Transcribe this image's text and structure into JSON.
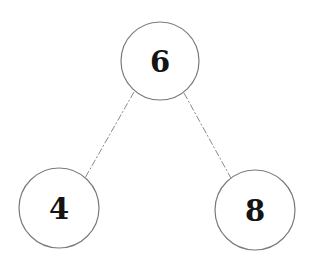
{
  "diagram": {
    "type": "binary-tree",
    "nodes": [
      {
        "id": "root",
        "label": "6",
        "cx": 160,
        "cy": 61,
        "r": 39
      },
      {
        "id": "left",
        "label": "4",
        "cx": 59,
        "cy": 208,
        "r": 40
      },
      {
        "id": "right",
        "label": "8",
        "cx": 255,
        "cy": 210,
        "r": 40
      }
    ],
    "edges": [
      {
        "from": "root",
        "to": "left",
        "x1": 134,
        "y1": 92,
        "x2": 85,
        "y2": 178
      },
      {
        "from": "root",
        "to": "right",
        "x1": 184,
        "y1": 93,
        "x2": 232,
        "y2": 180
      }
    ]
  }
}
